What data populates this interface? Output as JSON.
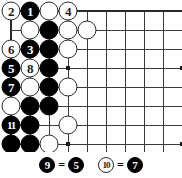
{
  "diagram": {
    "type": "go-board-problem",
    "board": {
      "grid_origin_x": 11,
      "grid_origin_y": 11,
      "grid_spacing": 19,
      "cols": 10,
      "rows": 8,
      "edge_top": true,
      "edge_left": true,
      "star_points": [
        {
          "col": 3,
          "row": 3
        },
        {
          "col": 9,
          "row": 3
        },
        {
          "col": 3,
          "row": 7
        },
        {
          "col": 9,
          "row": 7
        }
      ]
    },
    "stones": [
      {
        "col": 0,
        "row": 0,
        "color": "white",
        "label": "2"
      },
      {
        "col": 1,
        "row": 0,
        "color": "black",
        "label": "1"
      },
      {
        "col": 2,
        "row": 0,
        "color": "white",
        "label": ""
      },
      {
        "col": 3,
        "row": 0,
        "color": "white",
        "label": "4"
      },
      {
        "col": 1,
        "row": 1,
        "color": "white",
        "label": ""
      },
      {
        "col": 2,
        "row": 1,
        "color": "black",
        "label": ""
      },
      {
        "col": 3,
        "row": 1,
        "color": "white",
        "label": ""
      },
      {
        "col": 4,
        "row": 1,
        "color": "white",
        "label": ""
      },
      {
        "col": 0,
        "row": 2,
        "color": "white",
        "label": "6"
      },
      {
        "col": 1,
        "row": 2,
        "color": "black",
        "label": "3"
      },
      {
        "col": 2,
        "row": 2,
        "color": "black",
        "label": ""
      },
      {
        "col": 3,
        "row": 2,
        "color": "white",
        "label": ""
      },
      {
        "col": 0,
        "row": 3,
        "color": "black",
        "label": "5"
      },
      {
        "col": 1,
        "row": 3,
        "color": "white",
        "label": "8"
      },
      {
        "col": 2,
        "row": 3,
        "color": "black",
        "label": ""
      },
      {
        "col": 0,
        "row": 4,
        "color": "black",
        "label": "7"
      },
      {
        "col": 1,
        "row": 4,
        "color": "white",
        "label": ""
      },
      {
        "col": 2,
        "row": 4,
        "color": "black",
        "label": ""
      },
      {
        "col": 3,
        "row": 4,
        "color": "white",
        "label": ""
      },
      {
        "col": 0,
        "row": 5,
        "color": "white",
        "label": ""
      },
      {
        "col": 1,
        "row": 5,
        "color": "black",
        "label": ""
      },
      {
        "col": 2,
        "row": 5,
        "color": "black",
        "label": ""
      },
      {
        "col": 0,
        "row": 6,
        "color": "black",
        "label": "11"
      },
      {
        "col": 1,
        "row": 6,
        "color": "black",
        "label": ""
      },
      {
        "col": 3,
        "row": 6,
        "color": "white",
        "label": ""
      },
      {
        "col": 0,
        "row": 7,
        "color": "black",
        "label": ""
      },
      {
        "col": 1,
        "row": 7,
        "color": "black",
        "label": ""
      },
      {
        "col": 2,
        "row": 7,
        "color": "white",
        "label": ""
      },
      {
        "col": 1,
        "row": 8,
        "color": "white",
        "label": ""
      },
      {
        "col": 2,
        "row": 9,
        "color": "white",
        "label": ""
      }
    ],
    "caption": {
      "entries": [
        {
          "left_label": "9",
          "left_color": "black",
          "equals": "=",
          "right_label": "5",
          "right_color": "black"
        },
        {
          "left_label": "10",
          "left_color": "white",
          "equals": "=",
          "right_label": "7",
          "right_color": "black"
        }
      ]
    }
  },
  "colors": {
    "black_stone": "#000000",
    "white_stone": "#ffffff",
    "stone_outline": "#2a2a2a",
    "grid_line": "#3a3a3a",
    "edge_line": "#2a2a2a",
    "background": "#ffffff"
  }
}
